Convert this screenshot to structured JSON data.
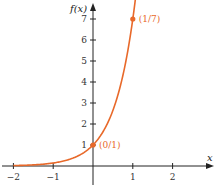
{
  "chart_data": {
    "type": "line",
    "title": "",
    "function": "f(x) = 7^x",
    "xlabel": "x",
    "ylabel": "f(x)",
    "xlim": [
      -2.1,
      2.0
    ],
    "ylim": [
      0,
      7.5
    ],
    "x_ticks": [
      -2,
      -1,
      1,
      2
    ],
    "x_tick_labels": [
      "−2",
      "−1",
      "1",
      "2"
    ],
    "y_ticks": [
      1,
      2,
      3,
      4,
      5,
      6,
      7
    ],
    "y_tick_labels": [
      "1",
      "2",
      "3",
      "4",
      "5",
      "6",
      "7"
    ],
    "grid": false,
    "legend": null,
    "series": [
      {
        "name": "f(x)",
        "color": "#E8692A",
        "x": [
          -2,
          -1.5,
          -1,
          -0.5,
          0,
          0.25,
          0.5,
          0.75,
          1,
          1.08
        ],
        "y": [
          0.02,
          0.054,
          0.143,
          0.378,
          1,
          1.63,
          2.65,
          4.3,
          7,
          8.2
        ]
      }
    ],
    "points": [
      {
        "x": 0,
        "y": 1,
        "label": "(0/1)"
      },
      {
        "x": 1,
        "y": 7,
        "label": "(1/7)"
      }
    ]
  },
  "colors": {
    "curve": "#E8692A",
    "axis": "#222222"
  }
}
